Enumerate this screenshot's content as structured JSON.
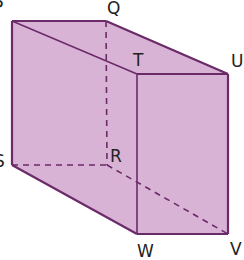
{
  "diagram": {
    "type": "cuboid",
    "colors": {
      "fill": "#d9b3d6",
      "edge": "#6b2a68",
      "label": "#222222"
    },
    "vertices": {
      "P": {
        "label": "P",
        "x": 12,
        "y": 21
      },
      "Q": {
        "label": "Q",
        "x": 106,
        "y": 21
      },
      "T": {
        "label": "T",
        "x": 137,
        "y": 74
      },
      "U": {
        "label": "U",
        "x": 228,
        "y": 74
      },
      "S": {
        "label": "S",
        "x": 12,
        "y": 165
      },
      "R": {
        "label": "R",
        "x": 107,
        "y": 165
      },
      "W": {
        "label": "W",
        "x": 137,
        "y": 234
      },
      "V": {
        "label": "V",
        "x": 228,
        "y": 234
      }
    },
    "labels": {
      "P": "P",
      "Q": "Q",
      "T": "T",
      "U": "U",
      "S": "S",
      "R": "R",
      "W": "W",
      "V": "V"
    },
    "solid_edges": [
      "PQ",
      "QU",
      "PT",
      "TU",
      "PS",
      "TW",
      "UV",
      "SW",
      "WV"
    ],
    "hidden_edges": [
      "QR",
      "SR",
      "RV"
    ]
  }
}
